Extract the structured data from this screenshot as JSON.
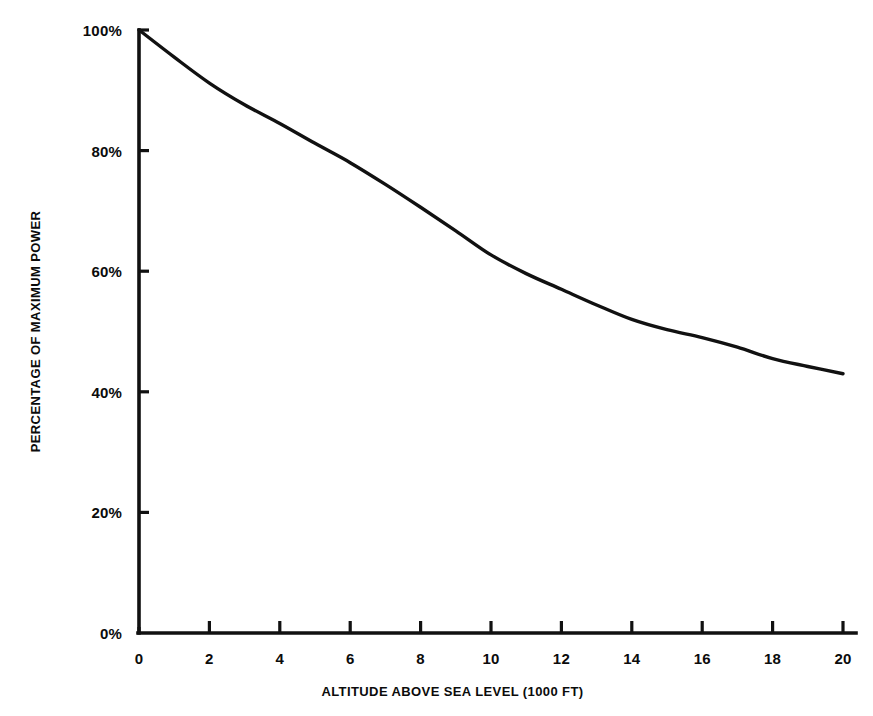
{
  "chart_data": {
    "type": "line",
    "title": "",
    "xlabel": "ALTITUDE ABOVE SEA LEVEL (1000 FT)",
    "ylabel": "PERCENTAGE OF MAXIMUM POWER",
    "xlim": [
      0,
      20
    ],
    "ylim": [
      0,
      100
    ],
    "grid": false,
    "legend": "none",
    "xticks": [
      0,
      2,
      4,
      6,
      8,
      10,
      12,
      14,
      16,
      18,
      20
    ],
    "xtick_labels": [
      "0",
      "2",
      "4",
      "6",
      "8",
      "10",
      "12",
      "14",
      "16",
      "18",
      "20"
    ],
    "yticks": [
      0,
      20,
      40,
      60,
      80,
      100
    ],
    "ytick_labels": [
      "0%",
      "20%",
      "40%",
      "60%",
      "80%",
      "100%"
    ],
    "series": [
      {
        "name": "Percentage of maximum power vs altitude",
        "color": "#111111",
        "line_width": 3,
        "x": [
          0,
          1,
          2,
          3,
          4,
          5,
          6,
          7,
          8,
          9,
          10,
          11,
          12,
          13,
          14,
          15,
          16,
          17,
          18,
          19,
          20
        ],
        "values": [
          100,
          95.5,
          91.2,
          87.6,
          84.5,
          81.2,
          78.0,
          74.4,
          70.6,
          66.7,
          62.7,
          59.6,
          57.0,
          54.4,
          52.0,
          50.3,
          49.0,
          47.4,
          45.5,
          44.2,
          43.0
        ]
      }
    ]
  },
  "axes": {
    "y_title": "PERCENTAGE OF MAXIMUM POWER",
    "x_title": "ALTITUDE ABOVE SEA LEVEL (1000 FT)"
  },
  "colors": {
    "background": "#ffffff",
    "ink": "#111111",
    "curve": "#111111"
  }
}
